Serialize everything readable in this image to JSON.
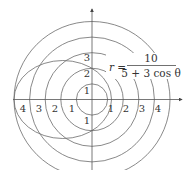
{
  "diagram": {
    "type": "polar-plot",
    "equation": {
      "lhs": "r =",
      "numerator": "10",
      "denominator": "5 + 3 cos θ"
    },
    "circles": [
      1,
      2,
      3,
      4,
      5
    ],
    "ellipse": {
      "r_at_0": 1.25,
      "r_at_pi": 5,
      "r_at_half_pi": 2
    },
    "x_axis_labels": {
      "negative": [
        "4",
        "3",
        "2",
        "1"
      ],
      "positive": [
        "1",
        "2",
        "3",
        "4"
      ]
    },
    "y_axis_labels": {
      "positive": [
        "1",
        "2",
        "3"
      ],
      "negative": [
        "1"
      ]
    },
    "colors": {
      "stroke": "#6b6b6b",
      "axis": "#555555",
      "text": "#333333"
    }
  }
}
